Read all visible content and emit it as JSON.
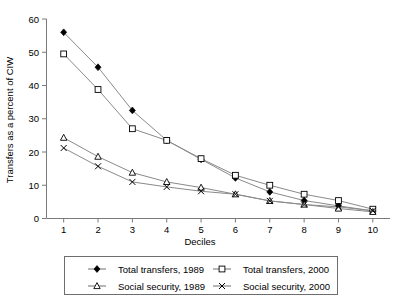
{
  "chart_data": {
    "type": "line",
    "title": "",
    "xlabel": "Deciles",
    "ylabel": "Transfers as a percent of CIW",
    "categories": [
      "1",
      "2",
      "3",
      "4",
      "5",
      "6",
      "7",
      "8",
      "9",
      "10"
    ],
    "x": [
      1,
      2,
      3,
      4,
      5,
      6,
      7,
      8,
      9,
      10
    ],
    "xlim": [
      0.5,
      10.5
    ],
    "ylim": [
      0,
      60
    ],
    "yticks": [
      0,
      10,
      20,
      30,
      40,
      50,
      60
    ],
    "ytick_labels": [
      "0",
      "10",
      "20",
      "30",
      "40",
      "50",
      "60"
    ],
    "xticks": [
      1,
      2,
      3,
      4,
      5,
      6,
      7,
      8,
      9,
      10
    ],
    "grid": false,
    "legend_position": "below-axes",
    "series": [
      {
        "name": "Total transfers, 1989",
        "marker": "filled-diamond",
        "values": [
          56.0,
          45.5,
          32.5,
          23.5,
          17.8,
          12.2,
          8.0,
          5.4,
          3.8,
          2.3
        ]
      },
      {
        "name": "Total transfers, 2000",
        "marker": "open-square",
        "values": [
          49.5,
          38.8,
          27.0,
          23.5,
          18.0,
          13.0,
          10.0,
          7.3,
          5.4,
          2.8
        ]
      },
      {
        "name": "Social security, 1989",
        "marker": "open-triangle",
        "values": [
          24.3,
          18.6,
          13.8,
          11.0,
          9.3,
          7.3,
          5.3,
          4.2,
          3.0,
          2.0
        ]
      },
      {
        "name": "Social security, 2000",
        "marker": "x-cross",
        "values": [
          21.2,
          15.7,
          11.0,
          9.5,
          8.2,
          7.3,
          5.3,
          4.2,
          3.5,
          2.3
        ]
      }
    ],
    "colors": {
      "line": "#8a8a8a",
      "axis": "#7a7a7a",
      "marker": "#000000",
      "background": "#ffffff"
    }
  },
  "legend": {
    "items": [
      {
        "label": "Total transfers, 1989",
        "marker": "filled-diamond"
      },
      {
        "label": "Total transfers, 2000",
        "marker": "open-square"
      },
      {
        "label": "Social security, 1989",
        "marker": "open-triangle"
      },
      {
        "label": "Social security, 2000",
        "marker": "x-cross"
      }
    ]
  }
}
